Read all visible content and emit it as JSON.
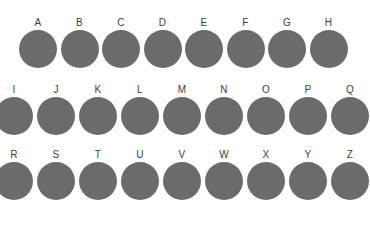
{
  "canvas": {
    "width": 362,
    "height": 215,
    "background_color": "#ffffff"
  },
  "style": {
    "dot_color": "#6b6b6b",
    "label_color": "#3c3c3c",
    "dot_diameter_px": 38,
    "label_font_size_px": 10
  },
  "rows": [
    {
      "row_id": "row-1",
      "top": 17,
      "start_x": 38,
      "spacing": 41.5,
      "cells": [
        {
          "label": "A"
        },
        {
          "label": "B"
        },
        {
          "label": "C"
        },
        {
          "label": "D"
        },
        {
          "label": "E"
        },
        {
          "label": "F"
        },
        {
          "label": "G"
        },
        {
          "label": "H"
        }
      ]
    },
    {
      "row_id": "row-2",
      "top": 84,
      "start_x": 14,
      "spacing": 42,
      "cells": [
        {
          "label": "I"
        },
        {
          "label": "J"
        },
        {
          "label": "K"
        },
        {
          "label": "L"
        },
        {
          "label": "M"
        },
        {
          "label": "N"
        },
        {
          "label": "O"
        },
        {
          "label": "P"
        },
        {
          "label": "Q"
        }
      ]
    },
    {
      "row_id": "row-3",
      "top": 149,
      "start_x": 14,
      "spacing": 42,
      "cells": [
        {
          "label": "R"
        },
        {
          "label": "S"
        },
        {
          "label": "T"
        },
        {
          "label": "U"
        },
        {
          "label": "V"
        },
        {
          "label": "W"
        },
        {
          "label": "X"
        },
        {
          "label": "Y"
        },
        {
          "label": "Z"
        }
      ]
    }
  ]
}
